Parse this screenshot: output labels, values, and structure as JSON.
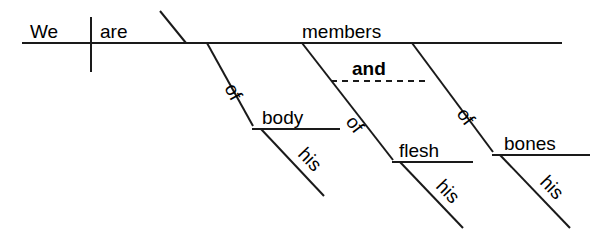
{
  "diagram": {
    "type": "reed-kellogg-sentence-diagram",
    "sentence": "We are members of his body and of his flesh and of his bones",
    "background_color": "#ffffff",
    "line_color": "#1a1a1a",
    "text_color": "#000000",
    "words": {
      "subject": "We",
      "verb": "are",
      "predicate_nominative": "members",
      "conjunction": "and",
      "prep1": "of",
      "prep1_object": "body",
      "prep1_modifier": "his",
      "prep2": "of",
      "prep2_object": "flesh",
      "prep2_modifier": "his",
      "prep3": "of",
      "prep3_object": "bones",
      "prep3_modifier": "his"
    },
    "labels": {
      "we": "We",
      "are": "are",
      "members": "members",
      "and": "and",
      "of_1": "of",
      "of_2": "of",
      "of_3": "of",
      "body": "body",
      "flesh": "flesh",
      "bones": "bones",
      "his_1": "his",
      "his_2": "his",
      "his_3": "his"
    }
  }
}
